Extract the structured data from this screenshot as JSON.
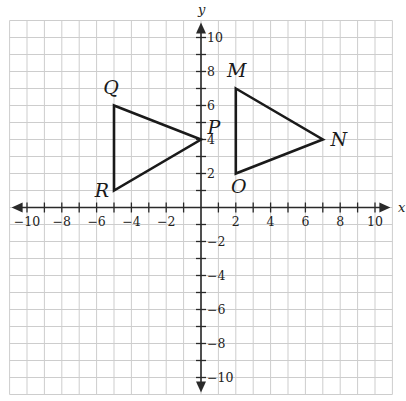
{
  "diagram": {
    "type": "coordinate-plane",
    "axes": {
      "x_label": "x",
      "y_label": "y",
      "x_range": [
        -11,
        11
      ],
      "y_range": [
        -11,
        11
      ],
      "tick_step": 1,
      "label_step": 2,
      "x_tick_labels": [
        "−10",
        "−8",
        "−6",
        "−4",
        "−2",
        "2",
        "4",
        "6",
        "8",
        "10"
      ],
      "y_tick_labels": [
        "10",
        "8",
        "6",
        "4",
        "2",
        "−2",
        "−4",
        "−6",
        "−8",
        "−10"
      ]
    },
    "colors": {
      "grid": "#cdcdcd",
      "axis": "#2a2a2a",
      "shape": "#1a1a1a",
      "background": "#ffffff"
    },
    "shapes": [
      {
        "name": "triangle-PQR",
        "vertices": [
          {
            "label": "Q",
            "x": -5,
            "y": 6
          },
          {
            "label": "P",
            "x": 0,
            "y": 4
          },
          {
            "label": "R",
            "x": -5,
            "y": 1
          }
        ]
      },
      {
        "name": "triangle-MNO",
        "vertices": [
          {
            "label": "M",
            "x": 2,
            "y": 7
          },
          {
            "label": "N",
            "x": 7,
            "y": 4
          },
          {
            "label": "O",
            "x": 2,
            "y": 2
          }
        ]
      }
    ]
  }
}
